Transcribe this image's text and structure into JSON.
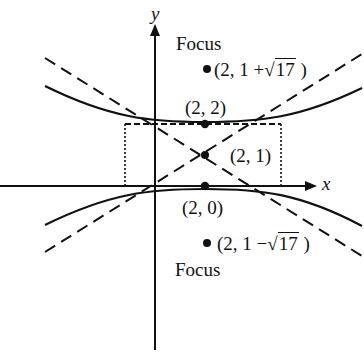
{
  "diagram": {
    "type": "hyperbola-graph",
    "axes": {
      "x_label": "x",
      "y_label": "y"
    },
    "center": {
      "label": "(2, 1)"
    },
    "vertices": [
      {
        "label": "(2, 2)"
      },
      {
        "label": "(2, 0)"
      }
    ],
    "foci": [
      {
        "title": "Focus",
        "prefix": "(2, 1 +",
        "radicand": "17",
        "suffix": ")"
      },
      {
        "title": "Focus",
        "prefix": "(2, 1 −",
        "radicand": "17",
        "suffix": ")"
      }
    ],
    "sqrt_symbol": "√",
    "colors": {
      "ink": "#111111",
      "background": "#ffffff"
    }
  }
}
